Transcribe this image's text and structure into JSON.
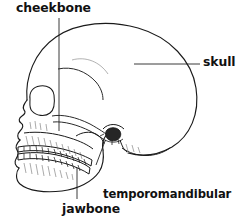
{
  "figure": {
    "type": "anatomical-diagram",
    "background_color": "#ffffff",
    "line_color": "#1a1a1a",
    "text_color": "#111111",
    "labels": [
      {
        "id": "cheekbone",
        "text": "cheekbone",
        "leader": "vertical line from label down to zygomatic arch"
      },
      {
        "id": "skull",
        "text": "skull",
        "leader": "horizontal line from label left to cranium"
      },
      {
        "id": "temporomandibular_joint",
        "line1": "temporomandibular",
        "line2": "joint",
        "leader": "diagonal line from label up-left to the jaw condyle"
      },
      {
        "id": "jawbone",
        "text": "jawbone",
        "leader": "vertical line from label up to the mandible body"
      }
    ]
  }
}
